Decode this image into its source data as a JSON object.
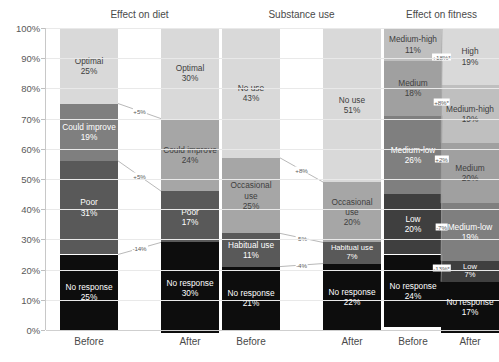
{
  "axis": {
    "y_ticks": [
      "100%",
      "90%",
      "80%",
      "70%",
      "60%",
      "50%",
      "40%",
      "30%",
      "20%",
      "10%",
      "0%"
    ],
    "y_min": 0,
    "y_max": 100
  },
  "groups": [
    {
      "title": "Effect on diet",
      "before_label": "Before",
      "after_label": "After",
      "before": [
        {
          "label": "Optimal",
          "value": "25%",
          "n": 25,
          "color": "#d9d9d9",
          "text": "#404040"
        },
        {
          "label": "Could improve",
          "value": "19%",
          "n": 19,
          "color": "#7f7f7f",
          "text": "#ffffff"
        },
        {
          "label": "Poor",
          "value": "31%",
          "n": 31,
          "color": "#595959",
          "text": "#ffffff"
        },
        {
          "label": "No response",
          "value": "25%",
          "n": 25,
          "color": "#0d0d0d",
          "text": "#ffffff"
        }
      ],
      "after": [
        {
          "label": "Optimal",
          "value": "30%",
          "n": 30,
          "color": "#d9d9d9",
          "text": "#404040"
        },
        {
          "label": "Could improve",
          "value": "24%",
          "n": 24,
          "color": "#a6a6a6",
          "text": "#404040"
        },
        {
          "label": "Poor",
          "value": "17%",
          "n": 17,
          "color": "#595959",
          "text": "#ffffff"
        },
        {
          "label": "No response",
          "value": "30%",
          "n": 30,
          "color": "#0d0d0d",
          "text": "#ffffff"
        }
      ],
      "deltas": [
        "+5%",
        "+5%",
        "-14%"
      ]
    },
    {
      "title": "Substance use",
      "before_label": "Before",
      "after_label": "After",
      "before": [
        {
          "label": "No use",
          "value": "43%",
          "n": 43,
          "color": "#d9d9d9",
          "text": "#404040"
        },
        {
          "label": "Occasional use",
          "value": "25%",
          "n": 25,
          "color": "#a6a6a6",
          "text": "#404040"
        },
        {
          "label": "Habitual use",
          "value": "11%",
          "n": 11,
          "color": "#595959",
          "text": "#ffffff"
        },
        {
          "label": "No response",
          "value": "21%",
          "n": 21,
          "color": "#0d0d0d",
          "text": "#ffffff"
        }
      ],
      "after": [
        {
          "label": "No use",
          "value": "51%",
          "n": 51,
          "color": "#d9d9d9",
          "text": "#404040"
        },
        {
          "label": "Occasional use",
          "value": "20%",
          "n": 20,
          "color": "#a6a6a6",
          "text": "#404040"
        },
        {
          "label": "Habitual use",
          "value": "7%",
          "n": 7,
          "color": "#595959",
          "text": "#ffffff"
        },
        {
          "label": "No response",
          "value": "22%",
          "n": 22,
          "color": "#0d0d0d",
          "text": "#ffffff"
        }
      ],
      "deltas": [
        "+8%",
        "-5%",
        "-4%"
      ]
    },
    {
      "title": "Effect on fitness",
      "before_label": "Before",
      "after_label": "After",
      "before": [
        {
          "label": "Medium-high",
          "value": "11%",
          "n": 11,
          "color": "#bfbfbf",
          "text": "#404040"
        },
        {
          "label": "Medium",
          "value": "18%",
          "n": 18,
          "color": "#a0a0a0",
          "text": "#404040"
        },
        {
          "label": "Medium-low",
          "value": "26%",
          "n": 26,
          "color": "#7f7f7f",
          "text": "#ffffff"
        },
        {
          "label": "Low",
          "value": "20%",
          "n": 20,
          "color": "#3f3f3f",
          "text": "#ffffff"
        },
        {
          "label": "No response",
          "value": "24%",
          "n": 24,
          "color": "#0d0d0d",
          "text": "#ffffff"
        }
      ],
      "after": [
        {
          "label": "High",
          "value": "19%",
          "n": 19,
          "color": "#d9d9d9",
          "text": "#404040"
        },
        {
          "label": "Medium-high",
          "value": "19%",
          "n": 19,
          "color": "#bfbfbf",
          "text": "#404040"
        },
        {
          "label": "Medium",
          "value": "20%",
          "n": 20,
          "color": "#a0a0a0",
          "text": "#404040"
        },
        {
          "label": "Medium-low",
          "value": "19%",
          "n": 19,
          "color": "#7f7f7f",
          "text": "#ffffff"
        },
        {
          "label": "Low",
          "value": "7%",
          "n": 7,
          "color": "#3f3f3f",
          "text": "#ffffff"
        },
        {
          "label": "No response",
          "value": "17%",
          "n": 17,
          "color": "#0d0d0d",
          "text": "#ffffff"
        }
      ],
      "deltas": [
        "+18%*",
        "+8%*",
        "+2%",
        "-7%",
        "-13%*"
      ]
    }
  ],
  "chart_data": {
    "type": "bar",
    "subtype": "100% stacked bar with before/after slope connectors",
    "title": "",
    "xlabel": "",
    "ylabel": "",
    "ylim": [
      0,
      100
    ],
    "y_tick_labels": [
      "0%",
      "10%",
      "20%",
      "30%",
      "40%",
      "50%",
      "60%",
      "70%",
      "80%",
      "90%",
      "100%"
    ],
    "grid": true,
    "legend": "none (in-bar labels)",
    "panels": [
      {
        "title": "Effect on diet",
        "categories": [
          "Before",
          "After"
        ],
        "series": [
          {
            "name": "Optimal",
            "values": [
              25,
              30
            ],
            "color": "#d9d9d9"
          },
          {
            "name": "Could improve",
            "values": [
              19,
              24
            ],
            "color": "#7f7f7f"
          },
          {
            "name": "Poor",
            "values": [
              31,
              17
            ],
            "color": "#595959"
          },
          {
            "name": "No response",
            "values": [
              25,
              30
            ],
            "color": "#0d0d0d"
          }
        ],
        "deltas": [
          {
            "series": "Optimal",
            "text": "+5%",
            "value": 5,
            "significant": false
          },
          {
            "series": "Could improve",
            "text": "+5%",
            "value": 5,
            "significant": false
          },
          {
            "series": "Poor",
            "text": "-14%",
            "value": -14,
            "significant": false
          }
        ]
      },
      {
        "title": "Substance use",
        "categories": [
          "Before",
          "After"
        ],
        "series": [
          {
            "name": "No use",
            "values": [
              43,
              51
            ],
            "color": "#d9d9d9"
          },
          {
            "name": "Occasional use",
            "values": [
              25,
              20
            ],
            "color": "#a6a6a6"
          },
          {
            "name": "Habitual use",
            "values": [
              11,
              7
            ],
            "color": "#595959"
          },
          {
            "name": "No response",
            "values": [
              21,
              22
            ],
            "color": "#0d0d0d"
          }
        ],
        "deltas": [
          {
            "series": "No use",
            "text": "+8%",
            "value": 8,
            "significant": false
          },
          {
            "series": "Occasional use",
            "text": "-5%",
            "value": -5,
            "significant": false
          },
          {
            "series": "Habitual use",
            "text": "-4%",
            "value": -4,
            "significant": false
          }
        ]
      },
      {
        "title": "Effect on fitness",
        "categories": [
          "Before",
          "After"
        ],
        "series": [
          {
            "name": "High",
            "values": [
              0,
              19
            ],
            "color": "#d9d9d9"
          },
          {
            "name": "Medium-high",
            "values": [
              11,
              19
            ],
            "color": "#bfbfbf"
          },
          {
            "name": "Medium",
            "values": [
              18,
              20
            ],
            "color": "#a0a0a0"
          },
          {
            "name": "Medium-low",
            "values": [
              26,
              19
            ],
            "color": "#7f7f7f"
          },
          {
            "name": "Low",
            "values": [
              20,
              7
            ],
            "color": "#3f3f3f"
          },
          {
            "name": "No response",
            "values": [
              24,
              17
            ],
            "color": "#0d0d0d"
          }
        ],
        "deltas": [
          {
            "series": "High / Medium-high",
            "text": "+18%*",
            "value": 18,
            "significant": true
          },
          {
            "series": "Medium-high / Medium",
            "text": "+8%*",
            "value": 8,
            "significant": true
          },
          {
            "series": "Medium",
            "text": "+2%",
            "value": 2,
            "significant": false
          },
          {
            "series": "Medium-low",
            "text": "-7%",
            "value": -7,
            "significant": false
          },
          {
            "series": "Low",
            "text": "-13%*",
            "value": -13,
            "significant": true
          }
        ]
      }
    ]
  }
}
